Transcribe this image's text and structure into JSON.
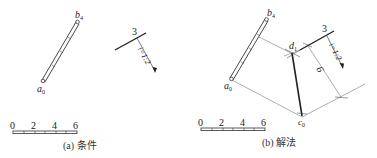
{
  "panels": [
    {
      "id": "a",
      "caption": "(a) 条件",
      "labels": {
        "b": "b",
        "b_sub": "4",
        "a": "a",
        "a_sub": "0",
        "three": "3",
        "ratio": "i=1:2"
      },
      "scale": {
        "ticks": [
          "0",
          "2",
          "4",
          "6"
        ]
      }
    },
    {
      "id": "b",
      "caption": "(b) 解法",
      "labels": {
        "b": "b",
        "b_sub": "4",
        "a": "a",
        "a_sub": "0",
        "d": "d",
        "d_sub": "1",
        "c": "c",
        "c_sub": "0",
        "three": "3",
        "ratio": "i=1:2",
        "six": "6"
      },
      "scale": {
        "ticks": [
          "0",
          "2",
          "4",
          "6"
        ]
      }
    }
  ],
  "colors": {
    "line": "#222222",
    "thin": "#777777",
    "background": "#ffffff"
  }
}
